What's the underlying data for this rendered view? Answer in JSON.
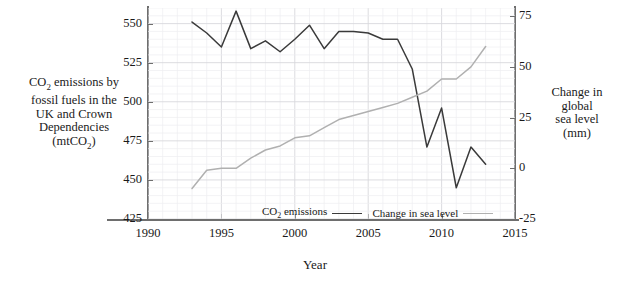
{
  "chart_data": {
    "type": "line",
    "title": "",
    "xlabel": "Year",
    "xlim": [
      1990,
      2015
    ],
    "xticks": [
      1990,
      1995,
      2000,
      2005,
      2010,
      2015
    ],
    "grid": true,
    "legend_position": "inside-bottom",
    "axes": [
      {
        "id": "left",
        "label": "CO2 emissions by fossil fuels in the UK and Crown Dependencies (mtCO2)",
        "label_lines": [
          "CO2 emissions by",
          "fossil fuels in the",
          "UK and Crown",
          "Dependencies",
          "(mtCO2)"
        ],
        "ylim": [
          425,
          560
        ],
        "yticks": [
          425,
          450,
          475,
          500,
          525,
          550
        ],
        "units": "mtCO2"
      },
      {
        "id": "right",
        "label": "Change in global sea level (mm)",
        "label_lines": [
          "Change in",
          "global",
          "sea level",
          "(mm)"
        ],
        "ylim": [
          -25,
          79
        ],
        "yticks": [
          -25,
          0,
          25,
          50,
          75
        ],
        "units": "mm"
      }
    ],
    "x": [
      1993,
      1994,
      1995,
      1996,
      1997,
      1998,
      1999,
      2000,
      2001,
      2002,
      2003,
      2004,
      2005,
      2006,
      2007,
      2008,
      2009,
      2010,
      2011,
      2012,
      2013
    ],
    "series": [
      {
        "name": "CO2 emissions",
        "legend_label": "CO2 emissions",
        "axis": "left",
        "color": "#3a3a3a",
        "values": [
          551,
          544,
          535,
          558,
          534,
          539,
          532,
          540,
          549,
          534,
          545,
          545,
          544,
          540,
          540,
          521,
          471,
          496,
          445,
          471,
          460
        ]
      },
      {
        "name": "Change in sea level",
        "legend_label": "Change in sea level",
        "axis": "right",
        "color": "#b0b0b0",
        "values": [
          -10,
          -1,
          0,
          0,
          5,
          9,
          11,
          15,
          16,
          20,
          24,
          26,
          28,
          30,
          32,
          35,
          38,
          44,
          44,
          50,
          60
        ]
      }
    ]
  },
  "labels": {
    "y_left_line1": "CO",
    "y_left_sub1": "2",
    "y_left_rest1": " emissions by",
    "y_left_line2": "fossil fuels in the",
    "y_left_line3": "UK and Crown",
    "y_left_line4": "Dependencies",
    "y_left_line5a": "(mtCO",
    "y_left_sub2": "2",
    "y_left_line5b": ")",
    "y_right_line1": "Change in",
    "y_right_line2": "global",
    "y_right_line3": "sea level",
    "y_right_line4": "(mm)",
    "x_axis": "Year",
    "legend_co2_a": "CO",
    "legend_co2_sub": "2",
    "legend_co2_b": " emissions",
    "legend_sea": "Change in sea level"
  }
}
